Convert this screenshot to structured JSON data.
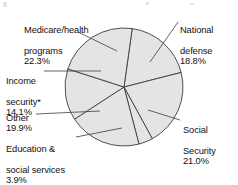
{
  "chart_data": {
    "type": "pie",
    "title": "",
    "subtitle": "",
    "xlabel": "",
    "ylabel": "",
    "legend_position": "callout-labels",
    "grid": false,
    "units": "percent",
    "total": 100.0,
    "footnote_marker": "*",
    "categories": [
      "National defense",
      "Social Security",
      "Education & social services",
      "Other",
      "Income security*",
      "Medicare/health programs"
    ],
    "values": [
      18.8,
      21.0,
      3.9,
      19.9,
      14.1,
      22.3
    ],
    "slices": [
      {
        "id": "national-defense",
        "name": "National defense",
        "value": 18.8,
        "value_label": "18.8%",
        "label_line1": "National",
        "label_line2": "defense",
        "start_angle": 8,
        "end_angle": 75.7,
        "fill": "#e4e4e4"
      },
      {
        "id": "social-security",
        "name": "Social Security",
        "value": 21.0,
        "value_label": "21.0%",
        "label_line1": "Social",
        "label_line2": "Security",
        "start_angle": 75.7,
        "end_angle": 151.3,
        "fill": "#e4e4e4"
      },
      {
        "id": "education-social-services",
        "name": "Education & social services",
        "value": 3.9,
        "value_label": "3.9%",
        "label_line1": "Education &",
        "label_line2": "social services",
        "start_angle": 151.3,
        "end_angle": 165.3,
        "fill": "#e4e4e4"
      },
      {
        "id": "other",
        "name": "Other",
        "value": 19.9,
        "value_label": "19.9%",
        "label_line1": "Other",
        "label_line2": "",
        "start_angle": 165.3,
        "end_angle": 237.0,
        "fill": "#e4e4e4"
      },
      {
        "id": "income-security",
        "name": "Income security*",
        "value": 14.1,
        "value_label": "14.1%",
        "label_line1": "Income",
        "label_line2": "security*",
        "start_angle": 237.0,
        "end_angle": 287.8,
        "fill": "#e4e4e4"
      },
      {
        "id": "medicare-health-programs",
        "name": "Medicare/health programs",
        "value": 22.3,
        "value_label": "22.3%",
        "label_line1": "Medicare/health",
        "label_line2": "programs",
        "start_angle": 287.8,
        "end_angle": 368.0,
        "fill": "#e4e4e4"
      }
    ],
    "colors": {
      "slice_fill": "#e4e4e4",
      "slice_stroke": "#3d3d3d",
      "leader_line": "#3d3d3d",
      "text": "#111111",
      "background": "#ffffff"
    },
    "geometry": {
      "center_x": 124,
      "center_y": 87,
      "radius": 59
    }
  },
  "labels": {
    "medicare": {
      "line1": "Medicare/health",
      "line2": "programs",
      "pct": "22.3%"
    },
    "national": {
      "line1": "National",
      "line2": "defense",
      "pct": "18.8%"
    },
    "income": {
      "line1": "Income",
      "line2": "security*",
      "pct": "14.1%"
    },
    "other": {
      "line1": "Other",
      "line2": "",
      "pct": "19.9%"
    },
    "education": {
      "line1": "Education &",
      "line2": "social services",
      "pct": "3.9%"
    },
    "social": {
      "line1": "Social",
      "line2": "Security",
      "pct": "21.0%"
    }
  }
}
